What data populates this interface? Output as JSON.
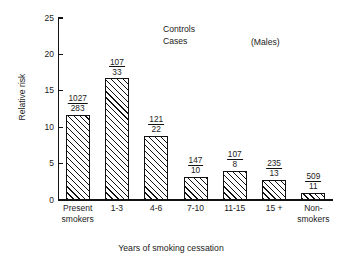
{
  "chart_data": {
    "type": "bar",
    "title": "",
    "xlabel": "Years of smoking cessation",
    "ylabel": "Relative risk",
    "ylim": [
      0,
      25
    ],
    "yticks": [
      0,
      5,
      10,
      15,
      20,
      25
    ],
    "ytick_labels": [
      "0",
      "5",
      "10",
      "15",
      "20",
      "25"
    ],
    "grid": false,
    "legend_position": "upper-center",
    "categories": [
      "Present\nsmokers",
      "1-3",
      "4-6",
      "7-10",
      "11-15",
      "15 +",
      "Non-\nsmokers"
    ],
    "values": [
      11.7,
      16.7,
      8.8,
      3.2,
      4.0,
      2.8,
      1.0
    ],
    "series": [
      {
        "name": "Relative risk",
        "values": [
          11.7,
          16.7,
          8.8,
          3.2,
          4.0,
          2.8,
          1.0
        ]
      }
    ],
    "point_labels": [
      {
        "controls": "1027",
        "cases": "283"
      },
      {
        "controls": "107",
        "cases": "33"
      },
      {
        "controls": "121",
        "cases": "22"
      },
      {
        "controls": "147",
        "cases": "10"
      },
      {
        "controls": "107",
        "cases": "8"
      },
      {
        "controls": "235",
        "cases": "13"
      },
      {
        "controls": "509",
        "cases": "11"
      }
    ],
    "annotations": [
      {
        "name": "legend-note",
        "text": "Controls\nCases"
      },
      {
        "name": "sex-note",
        "text": "(Males)"
      }
    ],
    "bar_style": {
      "fill": "hatched-diagonal",
      "edge_color": "#111111",
      "face_color": "#ffffff"
    }
  },
  "axes": {
    "y_title": "Relative risk",
    "x_title": "Years of smoking cessation",
    "ticks": [
      {
        "label": "25",
        "value": 25
      },
      {
        "label": "20",
        "value": 20
      },
      {
        "label": "15",
        "value": 15
      },
      {
        "label": "10",
        "value": 10
      },
      {
        "label": "5",
        "value": 5
      },
      {
        "label": "0",
        "value": 0
      }
    ]
  },
  "notes": {
    "legend": "Controls\nCases",
    "sex": "(Males)"
  }
}
